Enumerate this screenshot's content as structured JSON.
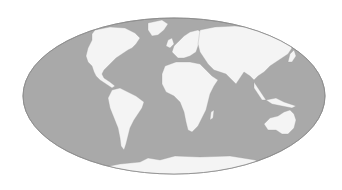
{
  "map": {
    "projection": "Mollweide",
    "colors": {
      "background": "#ffffff",
      "ocean": "#a9a9a9",
      "land": "#f4f4f4",
      "outline": "#8c8c8c",
      "ice": "#f7f7f7"
    },
    "regions": [
      "North America",
      "Greenland",
      "South America",
      "Europe",
      "Africa",
      "Asia",
      "Australia",
      "Antarctica"
    ]
  }
}
